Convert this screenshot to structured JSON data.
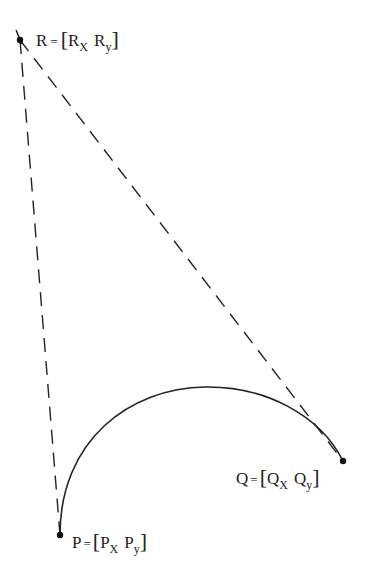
{
  "diagram": {
    "type": "conic-bezier-construction",
    "points": {
      "R": {
        "name": "R",
        "label_lhs": "R",
        "eq": "=",
        "x_comp": "R",
        "x_sub": "X",
        "y_comp": "R",
        "y_sub": "y"
      },
      "Q": {
        "name": "Q",
        "label_lhs": "Q",
        "eq": "=",
        "x_comp": "Q",
        "x_sub": "X",
        "y_comp": "Q",
        "y_sub": "y"
      },
      "P": {
        "name": "P",
        "label_lhs": "P",
        "eq": "=",
        "x_comp": "P",
        "x_sub": "X",
        "y_comp": "P",
        "y_sub": "y"
      }
    },
    "lines": [
      {
        "from": "R",
        "to": "P",
        "style": "dashed"
      },
      {
        "from": "R",
        "to": "Q",
        "style": "dashed"
      }
    ],
    "curve": {
      "from": "P",
      "to": "Q",
      "style": "solid"
    },
    "colors": {
      "ink": "#222222",
      "background": "#ffffff"
    }
  }
}
